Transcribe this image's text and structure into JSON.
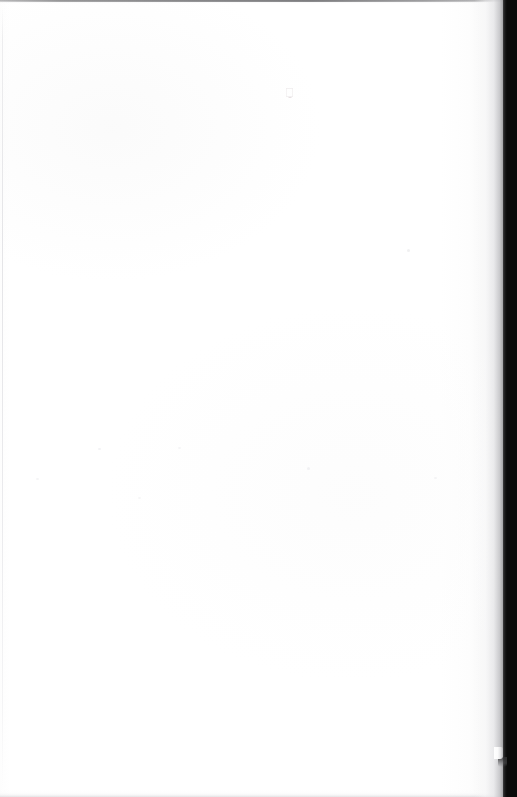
{
  "document": {
    "kind": "scanned-page",
    "page_state": "blank",
    "visible_text": "",
    "width_px": 517,
    "height_px": 797
  },
  "page": {
    "label": "blank-scanned-page",
    "background_color": "#ffffff",
    "paper_tone_color": "#fdfdfd",
    "content_text": ""
  },
  "gutter": {
    "label": "binding-gutter-shadow",
    "color": "#0a0a0a",
    "edge_highlight_color": "#46464a",
    "shading_color": "#96969a"
  },
  "edges": {
    "top_shadow_color": "#60605f",
    "bottom_shadow_color": "#cdcdd0",
    "left_rule_color": "#e2e2e5"
  },
  "artifacts": {
    "scan_speck_color": "#c6babe",
    "dust_color": "#eeeef0"
  }
}
